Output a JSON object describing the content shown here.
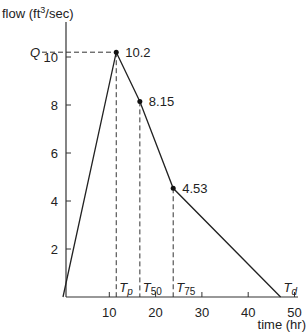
{
  "chart_data": {
    "type": "line",
    "title": "",
    "xlabel": "time (hr)",
    "ylabel": "flow (ft³/sec)",
    "ylabel_parts": {
      "pre": "flow (ft",
      "sup": "3",
      "post": "/sec)"
    },
    "xlim": [
      0,
      50
    ],
    "ylim": [
      0,
      11
    ],
    "x_ticks": [
      10,
      20,
      30,
      40,
      50
    ],
    "y_ticks": [
      2,
      4,
      6,
      8,
      10
    ],
    "grid": false,
    "series": [
      {
        "name": "hydrograph",
        "x": [
          0,
          11.5,
          16.6,
          23.8,
          47
        ],
        "y": [
          0,
          10.2,
          8.15,
          4.53,
          0
        ]
      }
    ],
    "annotations": [
      {
        "label": "10.2",
        "x": 11.5,
        "y": 10.2
      },
      {
        "label": "8.15",
        "x": 16.6,
        "y": 8.15
      },
      {
        "label": "4.53",
        "x": 23.8,
        "y": 4.53
      },
      {
        "label": "Q",
        "y": 10.2,
        "axis": "y"
      },
      {
        "label": "T",
        "sub": "p",
        "x": 11.5
      },
      {
        "label": "T",
        "sub": "50",
        "x": 16.6
      },
      {
        "label": "T",
        "sub": "75",
        "x": 23.8
      },
      {
        "label": "T",
        "sub": "d",
        "x": 47
      }
    ]
  }
}
